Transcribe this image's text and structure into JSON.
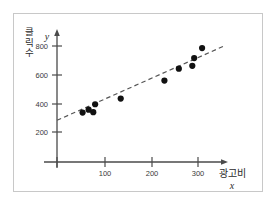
{
  "figure": {
    "border_color": "#c8c8c8",
    "background": "#ffffff",
    "axis_color": "#4a4a4a",
    "point_color": "#111111",
    "trend_color": "#555555"
  },
  "axes": {
    "y_axis_name": "클릭수",
    "y_axis_name_chars": [
      "클",
      "릭",
      "수"
    ],
    "y_axis_variable": "y",
    "x_axis_name": "광고비",
    "x_axis_variable": "x"
  },
  "chart_data": {
    "type": "scatter",
    "title": "",
    "xlabel": "광고비",
    "ylabel": "클릭수",
    "xlim": [
      0,
      360
    ],
    "ylim": [
      0,
      900
    ],
    "xticks": [
      100,
      200,
      300
    ],
    "yticks": [
      200,
      400,
      600,
      800
    ],
    "xtick_labels": [
      "100",
      "200",
      "300"
    ],
    "ytick_labels": [
      "200",
      "400",
      "600",
      "800"
    ],
    "grid": false,
    "legend": false,
    "points": [
      {
        "x": 55,
        "y": 342
      },
      {
        "x": 68,
        "y": 362
      },
      {
        "x": 78,
        "y": 345
      },
      {
        "x": 82,
        "y": 400
      },
      {
        "x": 137,
        "y": 440
      },
      {
        "x": 231,
        "y": 565
      },
      {
        "x": 262,
        "y": 648
      },
      {
        "x": 291,
        "y": 668
      },
      {
        "x": 295,
        "y": 722
      },
      {
        "x": 312,
        "y": 792
      }
    ],
    "trendline": {
      "style": "dashed",
      "x_start": 0,
      "y_start": 288,
      "x_end": 363,
      "y_end": 812
    }
  }
}
